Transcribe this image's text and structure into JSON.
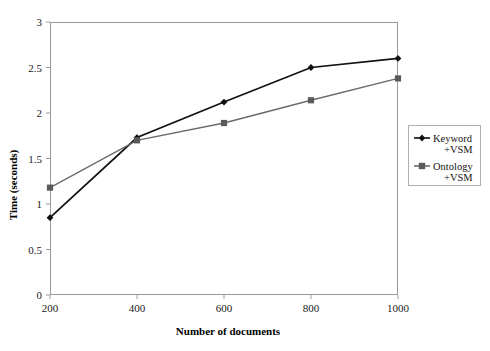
{
  "chart_data": {
    "type": "line",
    "title": "",
    "xlabel": "Number of documents",
    "ylabel": "Time (seconds)",
    "categories": [
      200,
      400,
      600,
      800,
      1000
    ],
    "x": [
      200,
      400,
      600,
      800,
      1000
    ],
    "xlim": [
      200,
      1000
    ],
    "ylim": [
      0,
      3
    ],
    "xticks": [
      "200",
      "400",
      "600",
      "800",
      "1000"
    ],
    "yticks": [
      "0",
      "0.5",
      "1",
      "1.5",
      "2",
      "2.5",
      "3"
    ],
    "grid": false,
    "legend_position": "right-outside",
    "series": [
      {
        "name": "Keyword +VSM",
        "label_line1": "Keyword",
        "label_line2": "+VSM",
        "values": [
          0.85,
          1.73,
          2.12,
          2.5,
          2.6
        ],
        "color": "#111111",
        "marker": "diamond"
      },
      {
        "name": "Ontology +VSM",
        "label_line1": "Ontology",
        "label_line2": "+VSM",
        "values": [
          1.18,
          1.7,
          1.89,
          2.14,
          2.38
        ],
        "color": "#6b6b6b",
        "marker": "square"
      }
    ]
  },
  "axes": {
    "x_title": "Number of documents",
    "y_title": "Time (seconds)"
  },
  "legend": {
    "entries": [
      {
        "line1": "Keyword",
        "line2": "+VSM"
      },
      {
        "line1": "Ontology",
        "line2": "+VSM"
      }
    ]
  },
  "layout": {
    "plot_left": 50,
    "plot_right": 398,
    "plot_top": 22,
    "plot_bottom": 295
  }
}
